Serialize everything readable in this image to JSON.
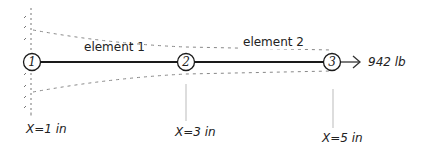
{
  "diagram": {
    "type": "bar-element finite element model",
    "colors": {
      "beam": "#1a1a1a",
      "dashed_outline": "#777777",
      "leader_line": "#999999",
      "text": "#222222",
      "background": "#ffffff"
    },
    "nodes": [
      {
        "id": "1",
        "label": "1",
        "position_label": "X=1 in"
      },
      {
        "id": "2",
        "label": "2",
        "position_label": "X=3 in"
      },
      {
        "id": "3",
        "label": "3",
        "position_label": "X=5 in"
      }
    ],
    "elements": [
      {
        "label": "element 1",
        "from": "1",
        "to": "2"
      },
      {
        "label": "element 2",
        "from": "2",
        "to": "3"
      }
    ],
    "load": {
      "node": "3",
      "label": "942 lb",
      "direction": "right"
    },
    "support": {
      "node": "1",
      "type": "fixed wall"
    }
  }
}
